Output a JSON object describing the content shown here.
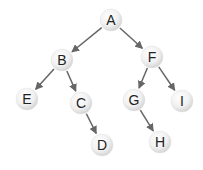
{
  "diagram": {
    "type": "binary-tree",
    "nodes": [
      {
        "id": "A",
        "label": "A",
        "x": 111,
        "y": 20
      },
      {
        "id": "B",
        "label": "B",
        "x": 62,
        "y": 60
      },
      {
        "id": "F",
        "label": "F",
        "x": 152,
        "y": 57
      },
      {
        "id": "E",
        "label": "E",
        "x": 27,
        "y": 99
      },
      {
        "id": "C",
        "label": "C",
        "x": 81,
        "y": 103
      },
      {
        "id": "G",
        "label": "G",
        "x": 134,
        "y": 100
      },
      {
        "id": "I",
        "label": "I",
        "x": 182,
        "y": 101
      },
      {
        "id": "D",
        "label": "D",
        "x": 102,
        "y": 145
      },
      {
        "id": "H",
        "label": "H",
        "x": 160,
        "y": 142
      }
    ],
    "edges": [
      {
        "from": "A",
        "to": "B"
      },
      {
        "from": "A",
        "to": "F"
      },
      {
        "from": "B",
        "to": "E"
      },
      {
        "from": "B",
        "to": "C"
      },
      {
        "from": "C",
        "to": "D"
      },
      {
        "from": "F",
        "to": "G"
      },
      {
        "from": "F",
        "to": "I"
      },
      {
        "from": "G",
        "to": "H"
      }
    ],
    "colors": {
      "node_fill_center": "#ffffff",
      "node_fill_edge": "#d6d6d6",
      "edge": "#666666",
      "text": "#222222"
    }
  }
}
